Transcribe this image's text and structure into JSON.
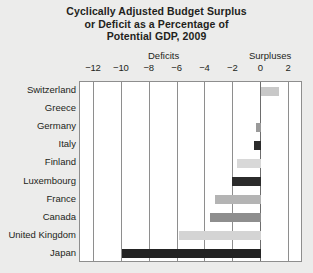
{
  "chart_data": {
    "type": "bar",
    "orientation": "horizontal",
    "title": "Cyclically Adjusted Budget Surplus or Deficit as a Percentage of Potential GDP, 2009",
    "title_lines": [
      "Cyclically Adjusted Budget Surplus",
      "or Deficit as a Percentage of",
      "Potential GDP, 2009"
    ],
    "xlabel": "",
    "ylabel": "",
    "left_header": "Deficits",
    "right_header": "Surpluses",
    "xlim": [
      -13,
      3
    ],
    "ticks": [
      -12,
      -10,
      -8,
      -6,
      -4,
      -2,
      0,
      2
    ],
    "tick_labels": [
      "−12",
      "−10",
      "−8",
      "−6",
      "−4",
      "−2",
      "0",
      "2"
    ],
    "grid": true,
    "legend": "none",
    "categories": [
      "Switzerland",
      "Greece",
      "Germany",
      "Italy",
      "Finland",
      "Luxembourg",
      "France",
      "Canada",
      "United Kingdom",
      "Japan"
    ],
    "values": [
      1.3,
      0.0,
      -0.4,
      -0.5,
      -1.7,
      -2.1,
      -3.3,
      -3.7,
      -5.9,
      -10.0
    ],
    "bar_colors": [
      "#c8c8c8",
      "#c8c8c8",
      "#9a9a9a",
      "#2b2b2b",
      "#d8d8d8",
      "#2b2b2b",
      "#b4b4b4",
      "#8e8e8e",
      "#d4d4d4",
      "#232323"
    ]
  },
  "colors": {
    "background": "#ececeb",
    "plot_background": "#ffffff",
    "frame": "#8e8e8e",
    "text": "#231f20"
  }
}
